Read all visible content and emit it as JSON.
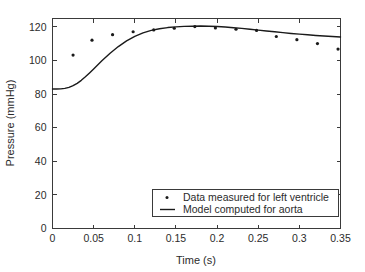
{
  "chart_data": {
    "type": "scatter",
    "title": "",
    "xlabel": "Time (s)",
    "ylabel": "Pressure (mmHg)",
    "xlim": [
      0,
      0.35
    ],
    "ylim": [
      0,
      125
    ],
    "xticks": [
      0,
      0.05,
      0.1,
      0.15,
      0.2,
      0.25,
      0.3,
      0.35
    ],
    "xticklabels": [
      "0",
      "0.05",
      "0.1",
      "0.15",
      "0.2",
      "0.25",
      "0.3",
      "0.35"
    ],
    "yticks": [
      0,
      20,
      40,
      60,
      80,
      100,
      120
    ],
    "yticklabels": [
      "0",
      "20",
      "40",
      "60",
      "80",
      "100",
      "120"
    ],
    "grid": false,
    "legend_position": "lower right",
    "series": [
      {
        "name": "Data measured for left ventricle",
        "type": "scatter",
        "marker": "point",
        "color": "#1a1a1a",
        "x": [
          0.025,
          0.048,
          0.073,
          0.098,
          0.123,
          0.148,
          0.173,
          0.198,
          0.223,
          0.248,
          0.272,
          0.297,
          0.322,
          0.347
        ],
        "y": [
          103.2,
          112.1,
          115.4,
          117.1,
          118.2,
          119.2,
          120.2,
          119.4,
          118.6,
          117.9,
          114.3,
          112.4,
          110.1,
          106.8
        ]
      },
      {
        "name": "Model computed for aorta",
        "type": "line",
        "color": "#1a1a1a",
        "x": [
          0,
          0.005,
          0.01,
          0.015,
          0.02,
          0.025,
          0.03,
          0.035,
          0.04,
          0.045,
          0.05,
          0.06,
          0.07,
          0.08,
          0.09,
          0.1,
          0.11,
          0.12,
          0.13,
          0.14,
          0.15,
          0.16,
          0.17,
          0.18,
          0.19,
          0.2,
          0.21,
          0.22,
          0.23,
          0.24,
          0.25,
          0.26,
          0.27,
          0.28,
          0.29,
          0.3,
          0.31,
          0.32,
          0.33,
          0.34,
          0.35
        ],
        "y": [
          83.0,
          83.0,
          83.1,
          83.4,
          84.0,
          85.0,
          86.4,
          88.2,
          90.3,
          92.6,
          95.0,
          99.8,
          104.3,
          108.3,
          111.7,
          114.4,
          116.4,
          117.9,
          118.9,
          119.6,
          120.0,
          120.3,
          120.4,
          120.5,
          120.4,
          120.2,
          119.9,
          119.5,
          119.1,
          118.6,
          118.1,
          117.6,
          117.1,
          116.6,
          116.1,
          115.7,
          115.3,
          114.9,
          114.6,
          114.3,
          114.0
        ]
      }
    ]
  },
  "legend": {
    "items": [
      {
        "label": "Data measured for left ventricle",
        "marker": "point"
      },
      {
        "label": "Model computed for aorta",
        "marker": "line"
      }
    ]
  }
}
